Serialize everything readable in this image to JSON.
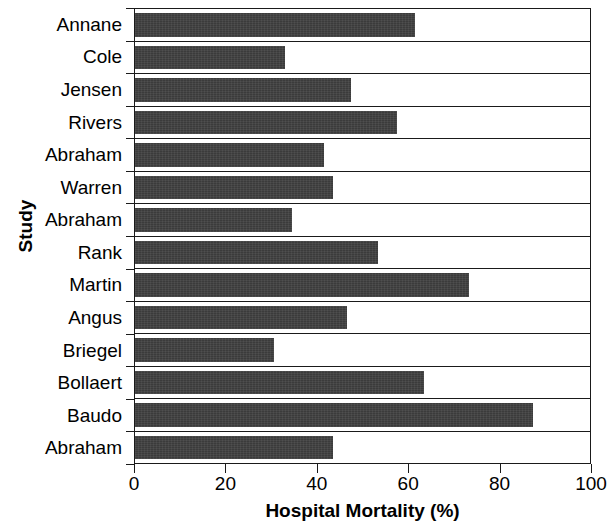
{
  "chart_data": {
    "type": "bar",
    "orientation": "horizontal",
    "title": "",
    "xlabel": "Hospital Mortality (%)",
    "ylabel": "Study",
    "xlim": [
      0,
      100
    ],
    "xticks": [
      0,
      20,
      40,
      60,
      80,
      100
    ],
    "xtick_labels": [
      "0",
      "20",
      "40",
      "60",
      "80",
      "100"
    ],
    "grid": false,
    "legend": null,
    "bar_color": "#3b3b3b",
    "axis_color": "#1a1a1a",
    "categories": [
      "Annane",
      "Cole",
      "Jensen",
      "Rivers",
      "Abraham",
      "Warren",
      "Abraham",
      "Rank",
      "Martin",
      "Angus",
      "Briegel",
      "Bollaert",
      "Baudo",
      "Abraham"
    ],
    "values": [
      61.5,
      33.0,
      47.5,
      57.5,
      41.5,
      43.5,
      34.5,
      53.5,
      73.5,
      46.5,
      30.5,
      63.5,
      87.5,
      43.5
    ]
  }
}
